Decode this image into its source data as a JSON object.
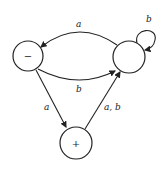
{
  "diagram": {
    "type": "finite-automaton",
    "states": [
      {
        "id": "start",
        "label": "−"
      },
      {
        "id": "middle",
        "label": ""
      },
      {
        "id": "final",
        "label": "+"
      }
    ],
    "edges": [
      {
        "from": "middle",
        "to": "start",
        "label": "a"
      },
      {
        "from": "start",
        "to": "middle",
        "label": "b"
      },
      {
        "from": "middle",
        "to": "middle",
        "label": "b"
      },
      {
        "from": "start",
        "to": "final",
        "label": "a"
      },
      {
        "from": "final",
        "to": "middle",
        "label": "a, b"
      }
    ]
  }
}
